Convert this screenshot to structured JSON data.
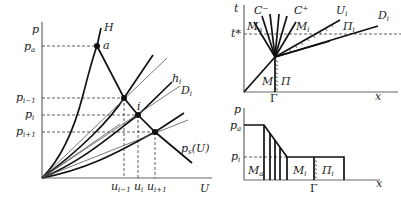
{
  "left_plot": {
    "y_axis_label": "p",
    "x_axis_label": "U",
    "y_ticks": [
      "p",
      "a",
      "p",
      "i−1",
      "p",
      "i",
      "p",
      "i+1"
    ],
    "y_labels": {
      "pa_main": "p",
      "pa_sub": "a",
      "pim1_main": "p",
      "pim1_sub": "i−1",
      "pi_main": "p",
      "pi_sub": "i",
      "pip1_main": "p",
      "pip1_sub": "i+1"
    },
    "x_labels": {
      "uim1_main": "u",
      "uim1_sub": "i−1",
      "ui_main": "u",
      "ui_sub": "i",
      "uip1_main": "u",
      "uip1_sub": "i+1"
    },
    "curve_labels": {
      "H": "H",
      "a": "a",
      "h_main": "h",
      "h_sub": "i",
      "D_main": "D",
      "D_sub": "i",
      "i": "i",
      "ps_main": "p",
      "ps_sub": "s",
      "ps_arg": "(U)"
    }
  },
  "top_right_plot": {
    "y_axis_label": "t",
    "x_axis_label": "x",
    "t_star": "t*",
    "gamma": "Γ",
    "labels": {
      "C_minus": "C⁻",
      "C_plus": "C⁺",
      "Ma_main": "M",
      "Ma_sub": "a",
      "Mi_main": "M",
      "Mi_sub": "i",
      "Ui_main": "U",
      "Ui_sub": "i",
      "Pi_main": "Π",
      "Pi_sub": "i",
      "Di_main": "D",
      "Di_sub": "i",
      "M": "M",
      "Pi": "Π"
    }
  },
  "bottom_right_plot": {
    "y_axis_label": "p",
    "x_axis_label": "x",
    "gamma": "Γ",
    "y_labels": {
      "pa_main": "p",
      "pa_sub": "a",
      "pi_main": "p",
      "pi_sub": "i"
    },
    "region_labels": {
      "Ma_main": "M",
      "Ma_sub": "a",
      "Mi_main": "M",
      "Mi_sub": "i",
      "Pi_main": "Π",
      "Pi_sub": "i"
    }
  }
}
